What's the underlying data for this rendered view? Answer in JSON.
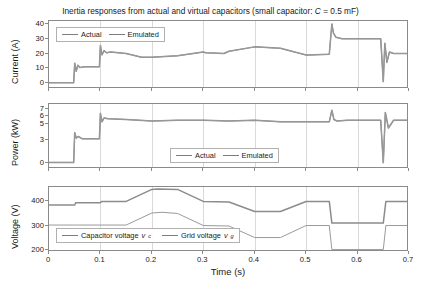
{
  "figure": {
    "title_prefix": "Inertia responses from actual and virtual capacitors (small capacitor: ",
    "title_var": "C",
    "title_suffix": " = 0.5 mF)",
    "xlabel": "Time (s)",
    "xticks": [
      "0",
      "0.1",
      "0.2",
      "0.3",
      "0.4",
      "0.5",
      "0.6",
      "0.7"
    ]
  },
  "legends": {
    "actual": "Actual",
    "emulated": "Emulated",
    "capacitor_voltage": "Capacitor voltage",
    "capacitor_voltage_sym": "v",
    "capacitor_voltage_sub": "c",
    "grid_voltage": "Grid voltage",
    "grid_voltage_sym": "v",
    "grid_voltage_sub": "g"
  },
  "colors": {
    "actual": "#8c8c8c",
    "emulated": "#9a9a9a",
    "axis": "#8a8a8a",
    "grid": "#d9d9d9",
    "text": "#1a1a1a"
  },
  "chart_data": [
    {
      "type": "line",
      "title": "Inertia responses from actual and virtual capacitors (small capacitor: C = 0.5 mF)",
      "xlabel": "",
      "ylabel": "Current (A)",
      "xlim": [
        0,
        0.7
      ],
      "ylim": [
        -4,
        42
      ],
      "xticks": [
        0,
        0.1,
        0.2,
        0.3,
        0.4,
        0.5,
        0.6,
        0.7
      ],
      "yticks": [
        0,
        10,
        20,
        30,
        40
      ],
      "grid": true,
      "legend": [
        "Actual",
        "Emulated"
      ],
      "legend_position": "upper-left",
      "series": [
        {
          "name": "Actual",
          "x": [
            0,
            0.048,
            0.05,
            0.053,
            0.056,
            0.06,
            0.07,
            0.098,
            0.1,
            0.103,
            0.107,
            0.112,
            0.12,
            0.15,
            0.18,
            0.2,
            0.25,
            0.3,
            0.305,
            0.34,
            0.35,
            0.4,
            0.45,
            0.5,
            0.505,
            0.545,
            0.55,
            0.553,
            0.558,
            0.57,
            0.6,
            0.645,
            0.65,
            0.653,
            0.657,
            0.662,
            0.67,
            0.7
          ],
          "y": [
            0.3,
            0.3,
            13.5,
            8.0,
            12.0,
            10.5,
            11.0,
            11.0,
            25.5,
            19.0,
            22.0,
            20.5,
            21.0,
            20.0,
            17.5,
            17.5,
            18.5,
            21.0,
            20.5,
            20.0,
            21.5,
            24.5,
            23.5,
            19.0,
            19.0,
            19.5,
            40.0,
            34.0,
            31.0,
            30.0,
            30.0,
            30.0,
            1.0,
            27.0,
            14.0,
            21.0,
            20.0,
            20.0
          ]
        },
        {
          "name": "Emulated",
          "x": [
            0,
            0.048,
            0.05,
            0.053,
            0.056,
            0.06,
            0.07,
            0.098,
            0.1,
            0.103,
            0.107,
            0.112,
            0.12,
            0.15,
            0.18,
            0.2,
            0.25,
            0.3,
            0.305,
            0.34,
            0.35,
            0.4,
            0.45,
            0.5,
            0.505,
            0.545,
            0.55,
            0.553,
            0.558,
            0.57,
            0.6,
            0.645,
            0.65,
            0.653,
            0.657,
            0.662,
            0.67,
            0.7
          ],
          "y": [
            0.3,
            0.3,
            13.5,
            8.0,
            12.0,
            10.5,
            11.0,
            11.0,
            25.5,
            19.0,
            22.0,
            20.5,
            21.0,
            20.0,
            17.5,
            17.5,
            18.5,
            21.0,
            20.5,
            20.0,
            21.5,
            24.5,
            23.5,
            19.0,
            19.0,
            19.5,
            40.0,
            34.0,
            31.0,
            30.0,
            30.0,
            30.0,
            1.0,
            27.0,
            14.0,
            21.0,
            20.0,
            20.0
          ]
        }
      ]
    },
    {
      "type": "line",
      "title": "",
      "xlabel": "",
      "ylabel": "Power (kW)",
      "xlim": [
        0,
        0.7
      ],
      "ylim": [
        -0.8,
        7.6
      ],
      "xticks": [
        0,
        0.1,
        0.2,
        0.3,
        0.4,
        0.5,
        0.6,
        0.7
      ],
      "yticks": [
        0,
        3,
        5,
        6,
        7
      ],
      "grid": true,
      "legend": [
        "Actual",
        "Emulated"
      ],
      "legend_position": "lower-center",
      "series": [
        {
          "name": "Actual",
          "x": [
            0,
            0.048,
            0.05,
            0.053,
            0.057,
            0.065,
            0.098,
            0.1,
            0.103,
            0.107,
            0.115,
            0.15,
            0.2,
            0.25,
            0.3,
            0.35,
            0.4,
            0.45,
            0.5,
            0.545,
            0.55,
            0.554,
            0.56,
            0.58,
            0.645,
            0.65,
            0.654,
            0.66,
            0.67,
            0.7
          ],
          "y": [
            0.05,
            0.05,
            3.9,
            3.2,
            3.4,
            3.1,
            3.1,
            6.4,
            5.3,
            5.8,
            5.7,
            5.6,
            5.4,
            5.5,
            5.5,
            5.4,
            5.5,
            5.3,
            5.3,
            5.3,
            6.8,
            5.6,
            5.4,
            5.5,
            5.5,
            0.0,
            6.5,
            4.5,
            5.5,
            5.5
          ]
        },
        {
          "name": "Emulated",
          "x": [
            0,
            0.048,
            0.05,
            0.053,
            0.057,
            0.065,
            0.098,
            0.1,
            0.103,
            0.107,
            0.115,
            0.15,
            0.2,
            0.25,
            0.3,
            0.35,
            0.4,
            0.45,
            0.5,
            0.545,
            0.55,
            0.554,
            0.56,
            0.58,
            0.645,
            0.65,
            0.654,
            0.66,
            0.67,
            0.7
          ],
          "y": [
            0.05,
            0.05,
            3.9,
            3.2,
            3.4,
            3.1,
            3.1,
            6.4,
            5.3,
            5.8,
            5.7,
            5.6,
            5.4,
            5.5,
            5.5,
            5.4,
            5.5,
            5.3,
            5.3,
            5.3,
            6.8,
            5.6,
            5.4,
            5.5,
            5.5,
            0.0,
            6.5,
            4.5,
            5.5,
            5.5
          ]
        }
      ]
    },
    {
      "type": "line",
      "title": "",
      "xlabel": "Time (s)",
      "ylabel": "Voltage (V)",
      "xlim": [
        0,
        0.7
      ],
      "ylim": [
        190,
        460
      ],
      "xticks": [
        0,
        0.1,
        0.2,
        0.3,
        0.4,
        0.5,
        0.6,
        0.7
      ],
      "yticks": [
        200,
        300,
        400
      ],
      "grid": true,
      "legend": [
        "Capacitor voltage v_c",
        "Grid voltage v_g"
      ],
      "legend_position": "lower-left",
      "series": [
        {
          "name": "Capacitor voltage v_c",
          "x": [
            0,
            0.05,
            0.052,
            0.1,
            0.102,
            0.15,
            0.2,
            0.21,
            0.25,
            0.3,
            0.35,
            0.4,
            0.45,
            0.5,
            0.545,
            0.55,
            0.65,
            0.655,
            0.7
          ],
          "y": [
            385,
            385,
            395,
            395,
            400,
            400,
            450,
            452,
            450,
            400,
            398,
            358,
            358,
            400,
            400,
            310,
            310,
            400,
            400
          ]
        },
        {
          "name": "Grid voltage v_g",
          "x": [
            0,
            0.05,
            0.1,
            0.15,
            0.2,
            0.22,
            0.25,
            0.3,
            0.35,
            0.4,
            0.45,
            0.5,
            0.545,
            0.55,
            0.65,
            0.655,
            0.7
          ],
          "y": [
            302,
            302,
            302,
            302,
            352,
            355,
            350,
            300,
            298,
            250,
            250,
            300,
            300,
            200,
            200,
            300,
            300
          ]
        }
      ]
    }
  ]
}
